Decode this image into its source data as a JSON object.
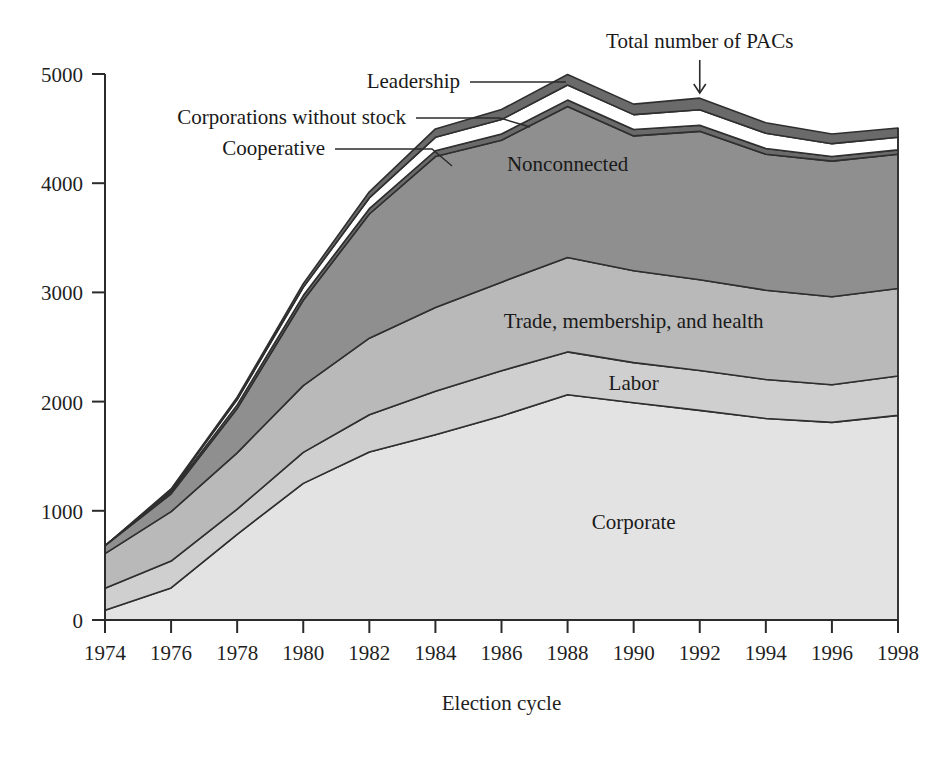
{
  "chart_data": {
    "type": "area",
    "title": "",
    "subtitle": "",
    "xlabel": "Election cycle",
    "ylabel": "",
    "stacked": true,
    "grid": false,
    "legend_position": "inline-labels",
    "xlim": [
      1974,
      1998
    ],
    "ylim": [
      0,
      5000
    ],
    "x": [
      1974,
      1976,
      1978,
      1980,
      1982,
      1984,
      1986,
      1988,
      1990,
      1992,
      1994,
      1996,
      1998
    ],
    "categories": [
      "1974",
      "1976",
      "1978",
      "1980",
      "1982",
      "1984",
      "1986",
      "1988",
      "1990",
      "1992",
      "1994",
      "1996",
      "1998"
    ],
    "y_ticks": [
      0,
      1000,
      2000,
      3000,
      4000,
      5000
    ],
    "y_tick_labels": [
      "0",
      "1000",
      "2000",
      "3000",
      "4000",
      "5000"
    ],
    "x_ticks": [
      1974,
      1976,
      1978,
      1980,
      1982,
      1984,
      1986,
      1988,
      1990,
      1992,
      1994,
      1996,
      1998
    ],
    "series": [
      {
        "name": "Corporate",
        "label": "Corporate",
        "color": "#e3e3e3",
        "values": [
          89,
          294,
          785,
          1251,
          1538,
          1697,
          1868,
          2063,
          1989,
          1920,
          1845,
          1810,
          1874
        ]
      },
      {
        "name": "Labor",
        "label": "Labor",
        "color": "#cfcfcf",
        "values": [
          201,
          246,
          230,
          284,
          342,
          397,
          414,
          392,
          368,
          365,
          357,
          345,
          361
        ]
      },
      {
        "name": "Trade, membership, and health",
        "label": "Trade, membership, and health",
        "color": "#b9b9b9",
        "values": [
          318,
          452,
          516,
          611,
          701,
          767,
          812,
          865,
          842,
          831,
          818,
          805,
          800
        ]
      },
      {
        "name": "Nonconnected",
        "label": "Nonconnected",
        "color": "#8f8f8f",
        "values": [
          72,
          163,
          405,
          782,
          1137,
          1383,
          1299,
          1382,
          1234,
          1359,
          1245,
          1242,
          1230
        ]
      },
      {
        "name": "Cooperative",
        "label": "Cooperative",
        "color": "#6a6a6a",
        "values": [
          0,
          20,
          34,
          43,
          49,
          53,
          58,
          59,
          59,
          56,
          53,
          42,
          40
        ]
      },
      {
        "name": "Corporations without stock",
        "label": "Corporations without stock",
        "color": "#ffffff",
        "values": [
          0,
          16,
          49,
          75,
          98,
          123,
          132,
          138,
          136,
          142,
          139,
          118,
          116
        ]
      },
      {
        "name": "Leadership",
        "label": "Leadership",
        "color": "#6a6a6a",
        "values": [
          0,
          9,
          21,
          34,
          56,
          77,
          92,
          97,
          96,
          106,
          96,
          89,
          85
        ]
      }
    ],
    "annotations": [
      {
        "name": "total-number-of-pacs",
        "text": "Total number of PACs",
        "pointer": "arrow-down",
        "target_year": 1992
      },
      {
        "name": "leadership",
        "text": "Leadership",
        "pointer": "leader-line",
        "target_year": 1988
      },
      {
        "name": "corporations-without-stock",
        "text": "Corporations without stock",
        "pointer": "leader-line",
        "target_year": 1985
      },
      {
        "name": "cooperative",
        "text": "Cooperative",
        "pointer": "leader-line",
        "target_year": 1983
      }
    ]
  }
}
